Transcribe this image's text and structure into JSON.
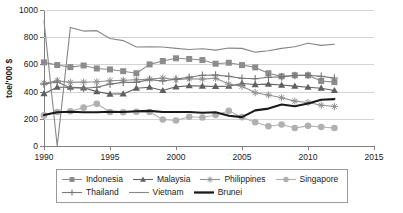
{
  "chart_data": {
    "type": "line",
    "title": "",
    "xlabel": "",
    "ylabel": "toe/'000 $",
    "xlim": [
      1990,
      2015
    ],
    "ylim": [
      0,
      1000
    ],
    "xticks": [
      1990,
      1995,
      2000,
      2005,
      2010,
      2015
    ],
    "yticks": [
      0,
      200,
      400,
      600,
      800,
      1000
    ],
    "grid": "horizontal",
    "legend_position": "bottom",
    "x": [
      1990,
      1991,
      1992,
      1993,
      1994,
      1995,
      1996,
      1997,
      1998,
      1999,
      2000,
      2001,
      2002,
      2003,
      2004,
      2005,
      2006,
      2007,
      2008,
      2009,
      2010,
      2011,
      2012
    ],
    "series": [
      {
        "name": "Indonesia",
        "marker": "square",
        "color": "#8c8c8c",
        "values": [
          615,
          595,
          580,
          592,
          570,
          563,
          550,
          535,
          600,
          625,
          645,
          640,
          632,
          605,
          612,
          595,
          578,
          535,
          512,
          520,
          520,
          478,
          470
        ]
      },
      {
        "name": "Malaysia",
        "marker": "triangle",
        "color": "#606060",
        "values": [
          385,
          432,
          432,
          428,
          400,
          382,
          383,
          425,
          432,
          408,
          435,
          443,
          440,
          438,
          440,
          460,
          452,
          455,
          448,
          440,
          432,
          425,
          408
        ]
      },
      {
        "name": "Philippines",
        "marker": "asterisk",
        "color": "#909090",
        "values": [
          462,
          480,
          468,
          470,
          472,
          480,
          483,
          487,
          492,
          500,
          488,
          495,
          492,
          498,
          455,
          440,
          392,
          375,
          355,
          330,
          320,
          300,
          290
        ]
      },
      {
        "name": "Singapore",
        "marker": "circle",
        "color": "#b0b0b0",
        "values": [
          225,
          250,
          255,
          282,
          310,
          250,
          248,
          252,
          250,
          195,
          188,
          215,
          210,
          228,
          258,
          212,
          175,
          145,
          158,
          132,
          148,
          140,
          132
        ]
      },
      {
        "name": "Thailand",
        "marker": "plus",
        "color": "#777777",
        "values": [
          455,
          470,
          428,
          425,
          432,
          455,
          468,
          468,
          488,
          478,
          492,
          505,
          520,
          522,
          512,
          498,
          495,
          505,
          508,
          518,
          520,
          512,
          500
        ]
      },
      {
        "name": "Vietnam",
        "marker": "none",
        "color": "#878787",
        "values": [
          920,
          0,
          872,
          845,
          848,
          790,
          775,
          728,
          730,
          728,
          718,
          710,
          715,
          705,
          720,
          718,
          690,
          700,
          718,
          730,
          755,
          740,
          748
        ]
      },
      {
        "name": "Brunei",
        "marker": "none-bold",
        "color": "#1a1a1a",
        "values": [
          228,
          248,
          252,
          248,
          248,
          252,
          250,
          255,
          258,
          250,
          250,
          250,
          245,
          248,
          222,
          212,
          262,
          275,
          305,
          292,
          312,
          340,
          345
        ]
      }
    ]
  },
  "axis": {
    "ytick_labels": [
      "0",
      "200",
      "400",
      "600",
      "800",
      "1000"
    ],
    "xtick_labels": [
      "1990",
      "1995",
      "2000",
      "2005",
      "2010",
      "2015"
    ],
    "y_axis_title": "toe/'000 $"
  },
  "legend": {
    "rows": [
      [
        {
          "label": "Indonesia",
          "marker": "square"
        },
        {
          "label": "Malaysia",
          "marker": "triangle"
        },
        {
          "label": "Philippines",
          "marker": "asterisk"
        },
        {
          "label": "Singapore",
          "marker": "circle"
        }
      ],
      [
        {
          "label": "Thailand",
          "marker": "plus"
        },
        {
          "label": "Vietnam",
          "marker": "none"
        },
        {
          "label": "Brunei",
          "marker": "none-bold"
        }
      ]
    ]
  }
}
